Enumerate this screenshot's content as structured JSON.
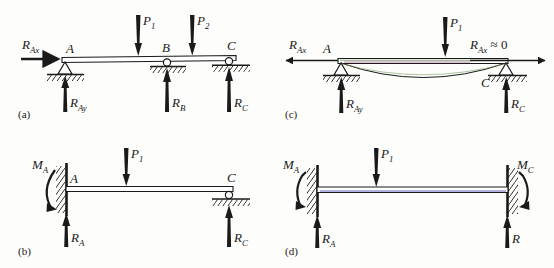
{
  "figure": {
    "type": "engineering-diagram",
    "background_color": "#fdfdfb",
    "ink_color": "#1a1a1a",
    "artifact_colors": {
      "green": "#6f8f5a",
      "magenta": "#9b5f88",
      "blue": "#4b4bb0"
    },
    "panels": [
      {
        "tag": "(a)",
        "description": "Simply supported continuous beam on three supports",
        "supports": [
          "pin-A",
          "roller-B",
          "roller-C"
        ],
        "node_labels": [
          "A",
          "B",
          "C"
        ],
        "loads": [
          "P1",
          "P2"
        ],
        "reactions": [
          "RAx",
          "RAy",
          "RB",
          "RC"
        ]
      },
      {
        "tag": "(b)",
        "description": "Propped cantilever: fixed at A, roller at C",
        "supports": [
          "fixed-A",
          "roller-C"
        ],
        "node_labels": [
          "A",
          "C"
        ],
        "loads": [
          "P1"
        ],
        "reactions": [
          "MA",
          "RA",
          "RC"
        ]
      },
      {
        "tag": "(c)",
        "description": "Pin supported beam with deflected shape, horizontal reaction negligible",
        "supports": [
          "pin-A",
          "pin-C"
        ],
        "node_labels": [
          "A",
          "C"
        ],
        "loads": [
          "P1"
        ],
        "reactions": [
          "RAx",
          "RAy",
          "RC",
          "RAx_right"
        ]
      },
      {
        "tag": "(d)",
        "description": "Beam fixed at both ends",
        "supports": [
          "fixed-A",
          "fixed-C"
        ],
        "node_labels": [],
        "loads": [
          "P1"
        ],
        "reactions": [
          "MA",
          "MC",
          "RA",
          "R"
        ]
      }
    ],
    "labels": {
      "panel_a_tag": "(a)",
      "panel_b_tag": "(b)",
      "panel_c_tag": "(c)",
      "panel_d_tag": "(d)",
      "a_RAx_main": "R",
      "a_RAx_sub": "Ax",
      "a_node_A": "A",
      "a_node_B": "B",
      "a_node_C": "C",
      "a_P1_main": "P",
      "a_P1_sub": "1",
      "a_P2_main": "P",
      "a_P2_sub": "2",
      "a_RAy_main": "R",
      "a_RAy_sub": "Ay",
      "a_RB_main": "R",
      "a_RB_sub": "B",
      "a_RC_main": "R",
      "a_RC_sub": "C",
      "b_MA_main": "M",
      "b_MA_sub": "A",
      "b_node_A": "A",
      "b_node_C": "C",
      "b_P1_main": "P",
      "b_P1_sub": "1",
      "b_RA_main": "R",
      "b_RA_sub": "A",
      "b_RC_main": "R",
      "b_RC_sub": "C",
      "c_RAx_main": "R",
      "c_RAx_sub": "Ax",
      "c_node_A": "A",
      "c_node_C": "C",
      "c_P1_main": "P",
      "c_P1_sub": "1",
      "c_RAx_right_main": "R",
      "c_RAx_right_sub": "Ax",
      "c_RAx_right_tail": "≈ 0",
      "c_RAy_main": "R",
      "c_RAy_sub": "Ay",
      "c_RC_main": "R",
      "c_RC_sub": "C",
      "d_MA_main": "M",
      "d_MA_sub": "A",
      "d_MC_main": "M",
      "d_MC_sub": "C",
      "d_P1_main": "P",
      "d_P1_sub": "1",
      "d_RA_main": "R",
      "d_RA_sub": "A",
      "d_R_main": "R"
    }
  }
}
